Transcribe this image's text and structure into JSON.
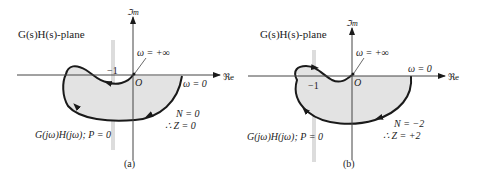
{
  "figure": {
    "panels": [
      {
        "id": "a",
        "plane_label": "G(s)H(s)-plane",
        "imag_axis_label": "ℑm",
        "real_axis_label": "ℜe",
        "minus_one_label": "−1",
        "origin_label": "O",
        "omega_inf_label": "ω = +∞",
        "omega_zero_label": "ω = 0",
        "curve_label": "G(jω)H(jω); P = 0",
        "n_label": "N = 0",
        "z_label": "∴ Z = 0",
        "caption": "(a)"
      },
      {
        "id": "b",
        "plane_label": "G(s)H(s)-plane",
        "imag_axis_label": "ℑm",
        "real_axis_label": "ℜe",
        "minus_one_label": "−1",
        "origin_label": "O",
        "omega_inf_label": "ω = +∞",
        "omega_zero_label": "ω = 0",
        "curve_label": "G(jω)H(jω); P = 0",
        "n_label": "N = −2",
        "z_label": "∴ Z = +2",
        "caption": "(b)"
      }
    ],
    "colors": {
      "line": "#1a1a1a",
      "fill": "#e3e3e3",
      "faint": "#d8d8d8"
    }
  }
}
